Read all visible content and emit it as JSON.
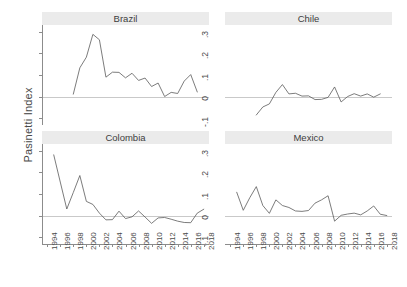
{
  "chart_data": {
    "type": "line",
    "title": "",
    "xlabel": "",
    "ylabel": "Pasinetti Index",
    "xlim": [
      1993.2,
      2018.8
    ],
    "ylim": [
      -0.13,
      0.33
    ],
    "grid": false,
    "legend": "none",
    "layout": "2x2 small multiples",
    "y_ticks": [
      0.3,
      0.2,
      0.1,
      0,
      -0.1
    ],
    "y_tick_labels": [
      ".3",
      ".2",
      ".1",
      "0",
      "-.1"
    ],
    "x_ticks": [
      1994,
      1996,
      1998,
      2000,
      2002,
      2004,
      2006,
      2008,
      2010,
      2012,
      2014,
      2016,
      2018
    ],
    "x_tick_labels": [
      "1994",
      "1996",
      "1998",
      "2000",
      "2002",
      "2004",
      "2006",
      "2008",
      "2010",
      "2012",
      "2014",
      "2016",
      "2018"
    ],
    "reference_line": 0,
    "panels": [
      {
        "name": "Brazil",
        "row": 0,
        "col": 0,
        "x": [
          1998,
          1999,
          2000,
          2001,
          2002,
          2003,
          2004,
          2005,
          2006,
          2007,
          2008,
          2009,
          2010,
          2011,
          2012,
          2013,
          2014,
          2015,
          2016,
          2017
        ],
        "values": [
          0.012,
          0.133,
          0.182,
          0.287,
          0.262,
          0.09,
          0.113,
          0.112,
          0.087,
          0.108,
          0.075,
          0.086,
          0.047,
          0.063,
          0.001,
          0.02,
          0.015,
          0.072,
          0.102,
          0.022
        ]
      },
      {
        "name": "Chile",
        "row": 0,
        "col": 1,
        "x": [
          1998,
          1999,
          2000,
          2001,
          2002,
          2003,
          2004,
          2005,
          2006,
          2007,
          2008,
          2009,
          2010,
          2011,
          2012,
          2013,
          2014,
          2015,
          2016,
          2017
        ],
        "values": [
          -0.084,
          -0.047,
          -0.033,
          0.02,
          0.056,
          0.013,
          0.016,
          0.003,
          0.004,
          -0.013,
          -0.012,
          -0.003,
          0.045,
          -0.024,
          0.001,
          0.014,
          0.003,
          0.013,
          -0.002,
          0.013
        ]
      },
      {
        "name": "Colombia",
        "row": 1,
        "col": 0,
        "x": [
          1995,
          1996,
          1997,
          1998,
          1999,
          2000,
          2001,
          2002,
          2003,
          2004,
          2005,
          2006,
          2007,
          2008,
          2009,
          2010,
          2011,
          2012,
          2013,
          2014,
          2015,
          2016,
          2017,
          2018
        ],
        "values": [
          0.28,
          0.155,
          0.031,
          0.107,
          0.185,
          0.066,
          0.052,
          0.012,
          -0.019,
          -0.018,
          0.021,
          -0.013,
          -0.005,
          0.022,
          -0.006,
          -0.035,
          -0.01,
          -0.008,
          -0.016,
          -0.025,
          -0.031,
          -0.032,
          0.012,
          0.03
        ]
      },
      {
        "name": "Mexico",
        "row": 1,
        "col": 1,
        "x": [
          1995,
          1996,
          1997,
          1998,
          1999,
          2000,
          2001,
          2002,
          2003,
          2004,
          2005,
          2006,
          2007,
          2008,
          2009,
          2010,
          2011,
          2012,
          2013,
          2014,
          2015,
          2016,
          2017,
          2018
        ],
        "values": [
          0.108,
          0.025,
          0.083,
          0.134,
          0.047,
          0.011,
          0.073,
          0.047,
          0.038,
          0.022,
          0.02,
          0.024,
          0.058,
          0.073,
          0.092,
          -0.025,
          0.002,
          0.008,
          0.012,
          0.004,
          0.022,
          0.045,
          0.007,
          0.001
        ]
      }
    ]
  }
}
